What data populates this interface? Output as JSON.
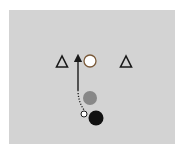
{
  "diagram": {
    "type": "drill-diagram",
    "field": {
      "color": "#d3d3d3"
    },
    "elements": [
      {
        "kind": "cone",
        "shape": "triangle",
        "label": "",
        "cx": 62,
        "cy": 62
      },
      {
        "kind": "player",
        "shape": "circle",
        "fill": "#ffffff",
        "label": "",
        "cx": 90,
        "cy": 61
      },
      {
        "kind": "cone",
        "shape": "triangle",
        "label": "",
        "cx": 126,
        "cy": 62
      },
      {
        "kind": "player",
        "shape": "circle",
        "fill": "#8a8a8a",
        "label": "",
        "cx": 90,
        "cy": 98
      },
      {
        "kind": "ball",
        "shape": "circle",
        "fill": "#ffffff",
        "label": "",
        "cx": 84,
        "cy": 114
      },
      {
        "kind": "player",
        "shape": "circle",
        "fill": "#111111",
        "label": "",
        "cx": 96,
        "cy": 118
      }
    ],
    "paths": [
      {
        "kind": "run",
        "style": "solid-arrow",
        "from": [
          78,
          90
        ],
        "to": [
          78,
          56
        ]
      },
      {
        "kind": "dribble",
        "style": "dotted",
        "from": [
          84,
          111
        ],
        "to": [
          78,
          90
        ]
      }
    ]
  }
}
